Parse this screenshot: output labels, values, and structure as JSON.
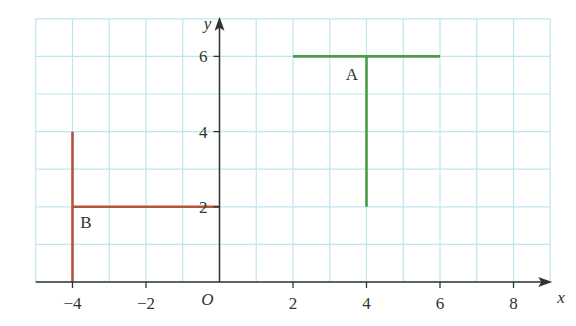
{
  "axes": {
    "x_label": "x",
    "y_label": "y",
    "origin_label": "O",
    "x_ticks": [
      {
        "value": -4,
        "label": "−4"
      },
      {
        "value": -2,
        "label": "−2"
      },
      {
        "value": 2,
        "label": "2"
      },
      {
        "value": 4,
        "label": "4"
      },
      {
        "value": 6,
        "label": "6"
      },
      {
        "value": 8,
        "label": "8"
      }
    ],
    "y_ticks": [
      {
        "value": 2,
        "label": "2"
      },
      {
        "value": 4,
        "label": "4"
      },
      {
        "value": 6,
        "label": "6"
      }
    ],
    "x_range": [
      -5,
      9
    ],
    "y_range": [
      0,
      7
    ]
  },
  "shapes": [
    {
      "label": "A",
      "color": "#4a9a4a",
      "segments": [
        {
          "from": [
            2,
            6
          ],
          "to": [
            6,
            6
          ]
        },
        {
          "from": [
            4,
            6
          ],
          "to": [
            4,
            2
          ]
        }
      ]
    },
    {
      "label": "B",
      "color": "#b5533c",
      "segments": [
        {
          "from": [
            -4,
            4
          ],
          "to": [
            -4,
            0
          ]
        },
        {
          "from": [
            -4,
            2
          ],
          "to": [
            0,
            2
          ]
        }
      ]
    }
  ],
  "colors": {
    "grid": "#bfe6ef",
    "axis": "#333333"
  }
}
